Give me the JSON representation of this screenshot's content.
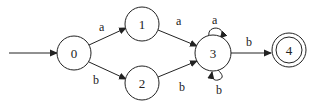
{
  "diagram": {
    "type": "finite-automaton",
    "start_state": "0",
    "accept_states": [
      "4"
    ],
    "states": [
      {
        "id": "0",
        "label": "0",
        "cx": 74,
        "cy": 53,
        "r": 17,
        "accepting": false
      },
      {
        "id": "1",
        "label": "1",
        "cx": 142,
        "cy": 24,
        "r": 17,
        "accepting": false
      },
      {
        "id": "2",
        "label": "2",
        "cx": 142,
        "cy": 83,
        "r": 17,
        "accepting": false
      },
      {
        "id": "3",
        "label": "3",
        "cx": 213,
        "cy": 53,
        "r": 18,
        "accepting": false
      },
      {
        "id": "4",
        "label": "4",
        "cx": 289,
        "cy": 50,
        "r": 17,
        "accepting": true
      }
    ],
    "transitions": [
      {
        "from": "0",
        "to": "1",
        "label": "a"
      },
      {
        "from": "0",
        "to": "2",
        "label": "b"
      },
      {
        "from": "1",
        "to": "3",
        "label": "a"
      },
      {
        "from": "2",
        "to": "3",
        "label": "b"
      },
      {
        "from": "3",
        "to": "3",
        "label": "a",
        "loop": "top"
      },
      {
        "from": "3",
        "to": "3",
        "label": "b",
        "loop": "bottom"
      },
      {
        "from": "3",
        "to": "4",
        "label": "b"
      }
    ],
    "colors": {
      "stroke": "#222222",
      "background": "#ffffff"
    }
  }
}
